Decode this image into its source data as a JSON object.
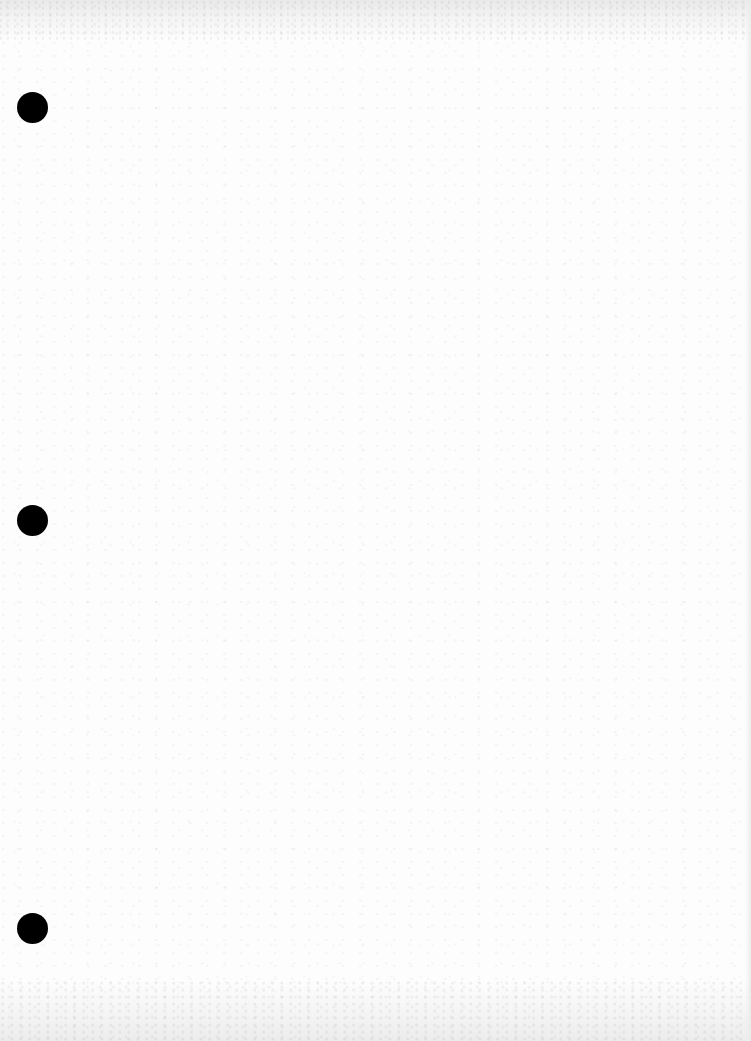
{
  "document": {
    "type": "blank scanned sheet",
    "text": "",
    "paper_color": "#fdfdfd",
    "punch_holes": {
      "count": 3,
      "color": "#000000",
      "side": "left",
      "order": [
        "top",
        "middle",
        "bottom"
      ]
    }
  }
}
